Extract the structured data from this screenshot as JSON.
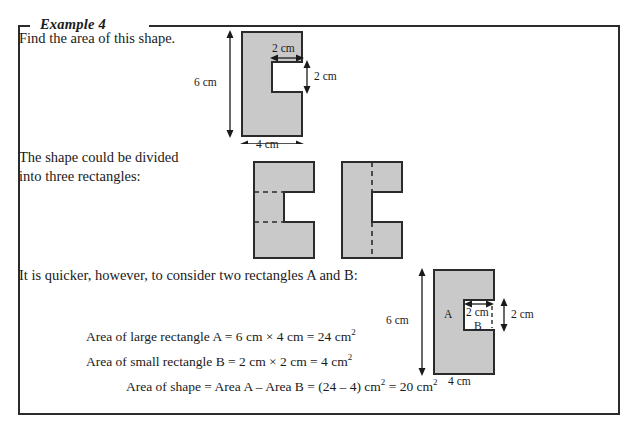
{
  "example": {
    "title": "Example 4"
  },
  "prose": {
    "prompt": "Find the area of this shape.",
    "divide": "The shape could be divided\ninto three rectangles:",
    "quicker": "It is quicker, however, to consider two rectangles A and B:"
  },
  "equations": {
    "large_rectangle": "Area of large rectangle A = 6 cm × 4 cm = 24 cm",
    "large_rectangle_exp": "2",
    "small_rectangle": "Area of small rectangle B = 2 cm × 2 cm =   4 cm",
    "small_rectangle_exp": "2",
    "shape_total_a": "Area of shape = Area A – Area B = (24 – 4) cm",
    "shape_total_exp_a": "2",
    "shape_total_b": " = 20 cm",
    "shape_total_exp_b": "2"
  },
  "figure_shape": {
    "height_label": "6 cm",
    "width_label": "4 cm",
    "notch_width_label": "2 cm",
    "notch_height_label": "2 cm"
  },
  "figure_ab": {
    "height_label": "6 cm",
    "width_label": "4 cm",
    "notch_width_label": "2 cm",
    "notch_height_label": "2 cm",
    "region_a_label": "A",
    "region_b_label": "B"
  },
  "colors": {
    "fill": "#c9c9c9",
    "stroke": "#2b2b2b",
    "text": "#1a1a1a",
    "page": "#ffffff"
  }
}
